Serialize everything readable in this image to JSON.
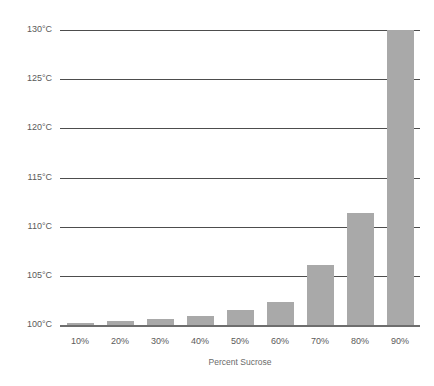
{
  "chart_data": {
    "type": "bar",
    "title": "",
    "xlabel": "Percent Sucrose",
    "ylabel": "",
    "categories": [
      "10%",
      "20%",
      "30%",
      "40%",
      "50%",
      "60%",
      "70%",
      "80%",
      "90%"
    ],
    "values": [
      100.2,
      100.4,
      100.6,
      100.9,
      101.5,
      102.3,
      106.1,
      111.4,
      130.0
    ],
    "value_unit": "°C",
    "ylim": [
      100,
      130
    ],
    "ytick_labels": [
      "100°C",
      "105°C",
      "110°C",
      "115°C",
      "120°C",
      "125°C",
      "130°C"
    ],
    "ytick_values": [
      100,
      105,
      110,
      115,
      120,
      125,
      130
    ],
    "grid": true,
    "legend": "none",
    "bar_color": "#a9a9a9",
    "gridline_color": "#4d4d4d",
    "axis_color": "#6e6e6e",
    "background_color": "#ffffff",
    "text_color": "#5a5a5a"
  }
}
